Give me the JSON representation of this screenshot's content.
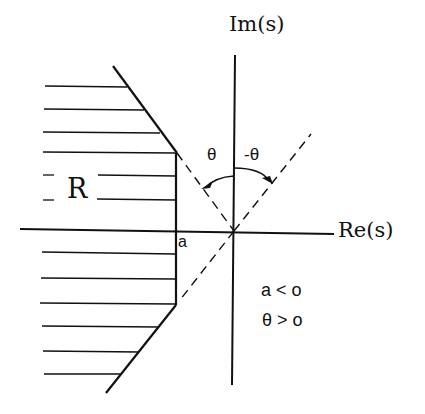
{
  "diagram": {
    "axes": {
      "imag_label": "Im(s)",
      "real_label": "Re(s)"
    },
    "region_label": "R",
    "point_label": "a",
    "angle_labels": {
      "left": "θ",
      "right": "-θ"
    },
    "conditions": [
      "a < o",
      "θ > o"
    ],
    "colors": {
      "ink": "#111111",
      "background": "#ffffff"
    }
  }
}
